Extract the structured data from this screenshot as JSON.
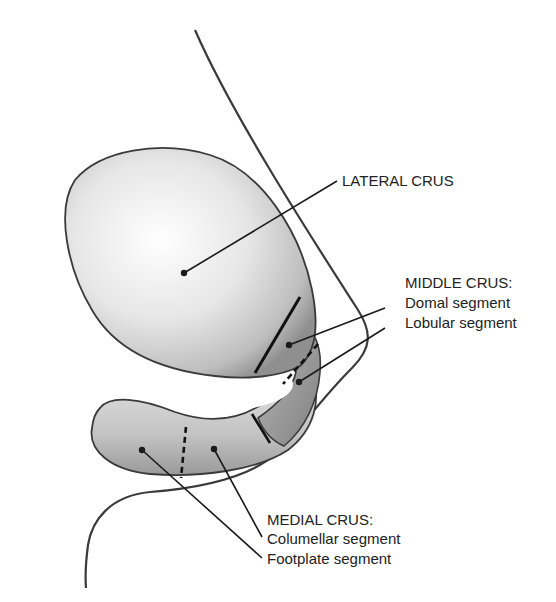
{
  "figure": {
    "colors": {
      "background": "#ffffff",
      "outline": "#3a3a3a",
      "cartilage_light": "#f2f2f2",
      "cartilage_mid": "#c8c8c8",
      "cartilage_dark": "#8c8c8c",
      "leader_line": "#1a1a1a"
    }
  },
  "labels": {
    "lateral_crus": "LATERAL CRUS",
    "middle_crus": {
      "heading": "MIDDLE CRUS:",
      "domal": "Domal segment",
      "lobular": "Lobular segment"
    },
    "medial_crus": {
      "heading": "MEDIAL CRUS:",
      "columellar": "Columellar segment",
      "footplate": "Footplate segment"
    }
  }
}
